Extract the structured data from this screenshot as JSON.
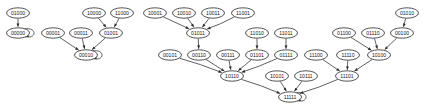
{
  "graph": {
    "title": "Binary State Transition Graph",
    "type": "directed-graph",
    "node_shape": "ellipse",
    "label_radix": "binary",
    "label_width_bits": 5,
    "colors": {
      "background": "#ffffff",
      "node_fill": "#ffffff",
      "node_stroke": "#2b2b2b",
      "label_text": "#191919",
      "edge_stroke": "#2b2b2b"
    },
    "node_size": {
      "rx": 11.5,
      "ry": 5.2
    },
    "nodes": [
      {
        "id": "01000",
        "label": "01000",
        "x": 18,
        "y": 13
      },
      {
        "id": "00000",
        "label": "00000",
        "x": 18,
        "y": 33
      },
      {
        "id": "00001",
        "label": "00001",
        "x": 53,
        "y": 33
      },
      {
        "id": "00011",
        "label": "00011",
        "x": 81,
        "y": 33
      },
      {
        "id": "10000",
        "label": "10000",
        "x": 94,
        "y": 13
      },
      {
        "id": "11000",
        "label": "11000",
        "x": 122,
        "y": 13
      },
      {
        "id": "01001",
        "label": "01001",
        "x": 111,
        "y": 33
      },
      {
        "id": "00010",
        "label": "00010",
        "x": 86,
        "y": 55
      },
      {
        "id": "10001",
        "label": "10001",
        "x": 155,
        "y": 13
      },
      {
        "id": "10010",
        "label": "10010",
        "x": 184,
        "y": 13
      },
      {
        "id": "10011",
        "label": "10011",
        "x": 213,
        "y": 13
      },
      {
        "id": "11001",
        "label": "11001",
        "x": 243,
        "y": 13
      },
      {
        "id": "01011",
        "label": "01011",
        "x": 198,
        "y": 33
      },
      {
        "id": "11010",
        "label": "11010",
        "x": 257,
        "y": 33
      },
      {
        "id": "11011",
        "label": "11011",
        "x": 286,
        "y": 33
      },
      {
        "id": "00101",
        "label": "00101",
        "x": 170,
        "y": 55
      },
      {
        "id": "00110",
        "label": "00110",
        "x": 199,
        "y": 55
      },
      {
        "id": "00111",
        "label": "00111",
        "x": 228,
        "y": 55
      },
      {
        "id": "01101",
        "label": "01101",
        "x": 257,
        "y": 55
      },
      {
        "id": "01111",
        "label": "01111",
        "x": 286,
        "y": 55
      },
      {
        "id": "01010",
        "label": "01010",
        "x": 407,
        "y": 13
      },
      {
        "id": "01100",
        "label": "01100",
        "x": 344,
        "y": 33
      },
      {
        "id": "01110",
        "label": "01110",
        "x": 373,
        "y": 33
      },
      {
        "id": "00100",
        "label": "00100",
        "x": 402,
        "y": 33
      },
      {
        "id": "11100",
        "label": "11100",
        "x": 316,
        "y": 55
      },
      {
        "id": "11110",
        "label": "11110",
        "x": 348,
        "y": 55
      },
      {
        "id": "10100",
        "label": "10100",
        "x": 379,
        "y": 55
      },
      {
        "id": "10110",
        "label": "10110",
        "x": 232,
        "y": 76
      },
      {
        "id": "10101",
        "label": "10101",
        "x": 277,
        "y": 76
      },
      {
        "id": "10111",
        "label": "10111",
        "x": 306,
        "y": 76
      },
      {
        "id": "11101",
        "label": "11101",
        "x": 347,
        "y": 76
      },
      {
        "id": "11111",
        "label": "11111",
        "x": 290,
        "y": 97
      }
    ],
    "edges": [
      {
        "from": "01000",
        "to": "00000"
      },
      {
        "from": "00000",
        "to": "00000",
        "self_loop": true
      },
      {
        "from": "10000",
        "to": "01001"
      },
      {
        "from": "11000",
        "to": "01001"
      },
      {
        "from": "00001",
        "to": "00010"
      },
      {
        "from": "00011",
        "to": "00010"
      },
      {
        "from": "01001",
        "to": "00010"
      },
      {
        "from": "00010",
        "to": "00010",
        "self_loop": true
      },
      {
        "from": "10001",
        "to": "01011"
      },
      {
        "from": "10010",
        "to": "01011"
      },
      {
        "from": "10011",
        "to": "01011"
      },
      {
        "from": "11001",
        "to": "01011"
      },
      {
        "from": "01011",
        "to": "00110"
      },
      {
        "from": "11010",
        "to": "01101"
      },
      {
        "from": "11011",
        "to": "01111"
      },
      {
        "from": "00101",
        "to": "10110"
      },
      {
        "from": "00110",
        "to": "10110"
      },
      {
        "from": "00111",
        "to": "10110"
      },
      {
        "from": "01101",
        "to": "10110"
      },
      {
        "from": "01111",
        "to": "10110"
      },
      {
        "from": "01010",
        "to": "00100"
      },
      {
        "from": "01100",
        "to": "10100"
      },
      {
        "from": "01110",
        "to": "10100"
      },
      {
        "from": "00100",
        "to": "10100"
      },
      {
        "from": "11100",
        "to": "11101"
      },
      {
        "from": "11110",
        "to": "11101"
      },
      {
        "from": "10100",
        "to": "11101"
      },
      {
        "from": "10110",
        "to": "11111"
      },
      {
        "from": "10101",
        "to": "11111"
      },
      {
        "from": "10111",
        "to": "11111"
      },
      {
        "from": "11101",
        "to": "11111"
      },
      {
        "from": "11111",
        "to": "11111",
        "self_loop": true
      }
    ]
  }
}
